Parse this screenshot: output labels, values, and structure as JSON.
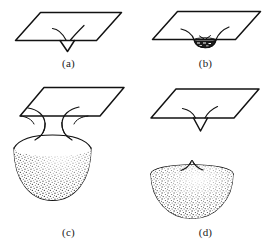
{
  "figure": {
    "background_color": "#ffffff",
    "ink_color": "#121212",
    "stipple_color": "#1b1b1b",
    "panel_count": 4
  },
  "panels": [
    {
      "key": "a",
      "label": "(a)",
      "caption": "(a)",
      "stage": "shallow V-shaped invagination in the flat membrane",
      "has_plane": true,
      "has_bud": false,
      "bud_size": "none",
      "stippled": false,
      "detached": false
    },
    {
      "key": "b",
      "label": "(b)",
      "caption": "(b)",
      "stage": "small shallow cup forming below the membrane plane",
      "has_plane": true,
      "has_bud": true,
      "bud_size": "small",
      "stippled": true,
      "detached": false
    },
    {
      "key": "c",
      "label": "(c)",
      "caption": "(c)",
      "stage": "large stippled bud hanging from a narrow constricted neck",
      "has_plane": true,
      "has_bud": true,
      "bud_size": "large",
      "stippled": true,
      "detached": false
    },
    {
      "key": "d",
      "label": "(d)",
      "caption": "(d)",
      "stage": "neck severed; free hemispherical vesicle released below the resealed membrane",
      "has_plane": true,
      "has_bud": true,
      "bud_size": "large",
      "stippled": true,
      "detached": true
    }
  ],
  "colors": {
    "ink": "#121212",
    "stipple": "#1b1b1b",
    "page": "#ffffff"
  }
}
